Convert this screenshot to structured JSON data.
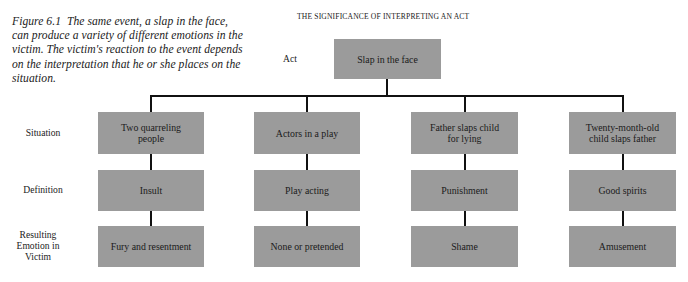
{
  "caption": {
    "figure_label": "Figure 6.1",
    "text": "The same event, a slap in the face, can produce a variety of different emotions in the victim. The victim's reaction to the event depends on the interpretation that he or she places on the situation."
  },
  "diagram": {
    "title": "THE SIGNIFICANCE OF INTERPRETING AN ACT",
    "row_labels": {
      "act": "Act",
      "situation": "Situation",
      "definition": "Definition",
      "emotion": "Resulting Emotion in Victim"
    },
    "act": "Slap in the face",
    "columns": [
      {
        "situation": "Two quarreling people",
        "definition": "Insult",
        "emotion": "Fury and resentment"
      },
      {
        "situation": "Actors in a play",
        "definition": "Play acting",
        "emotion": "None or pretended"
      },
      {
        "situation": "Father slaps child for lying",
        "definition": "Punishment",
        "emotion": "Shame"
      },
      {
        "situation": "Twenty-month-old child slaps father",
        "definition": "Good spirits",
        "emotion": "Amusement"
      }
    ],
    "colors": {
      "box": "#9b9b9b",
      "line": "#111111"
    }
  }
}
